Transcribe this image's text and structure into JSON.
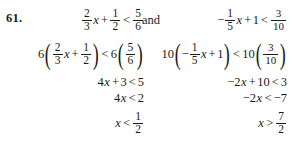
{
  "problem": {
    "number": "61.",
    "conjunction": "and"
  },
  "left": {
    "label": "left-inequality-solution",
    "line1": {
      "coef_num": "2",
      "coef_den": "3",
      "var": "x",
      "plus": "+",
      "const_num": "1",
      "const_den": "2",
      "relation": "<",
      "rhs_num": "5",
      "rhs_den": "6"
    },
    "line2": {
      "multiplier": "6",
      "open": "(",
      "coef_num": "2",
      "coef_den": "3",
      "var": "x",
      "plus": "+",
      "const_num": "1",
      "const_den": "2",
      "close": ")",
      "relation": "<",
      "multiplier2": "6",
      "open2": "(",
      "rhs_num": "5",
      "rhs_den": "6",
      "close2": ")"
    },
    "line3": "4x + 3 < 5",
    "line3_parts": {
      "coef": "4",
      "var": "x",
      "plus": "+",
      "const": "3",
      "relation": "<",
      "rhs": "5"
    },
    "line4_parts": {
      "coef": "4",
      "var": "x",
      "relation": "<",
      "rhs": "2"
    },
    "line5_parts": {
      "var": "x",
      "relation": "<",
      "rhs_num": "1",
      "rhs_den": "2"
    }
  },
  "right": {
    "label": "right-inequality-solution",
    "line1": {
      "minus": "−",
      "coef_num": "1",
      "coef_den": "5",
      "var": "x",
      "plus": "+",
      "const": "1",
      "relation": "<",
      "rhs_num": "3",
      "rhs_den": "10"
    },
    "line2": {
      "multiplier": "10",
      "open": "(",
      "minus": "−",
      "coef_num": "1",
      "coef_den": "5",
      "var": "x",
      "plus": "+",
      "const": "1",
      "close": ")",
      "relation": "<",
      "multiplier2": "10",
      "open2": "(",
      "rhs_num": "3",
      "rhs_den": "10",
      "close2": ")"
    },
    "line3_parts": {
      "coef": "−2",
      "var": "x",
      "plus": "+",
      "const": "10",
      "relation": "<",
      "rhs": "3"
    },
    "line4_parts": {
      "coef": "−2",
      "var": "x",
      "relation": "<",
      "rhs": "−7"
    },
    "line5_parts": {
      "var": "x",
      "relation": ">",
      "rhs_num": "7",
      "rhs_den": "2"
    }
  },
  "colors": {
    "background": "#ffffff",
    "text": "#1a1a1a"
  }
}
